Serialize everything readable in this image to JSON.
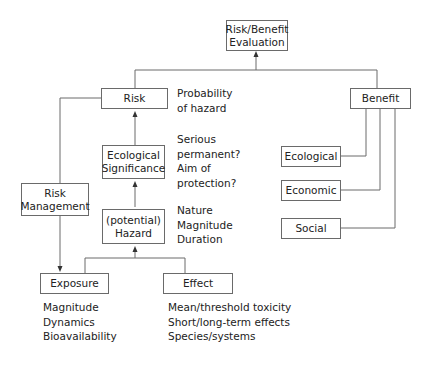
{
  "diagram": {
    "top": {
      "label_line1": "Risk/Benefit",
      "label_line2": "Evaluation"
    },
    "risk": {
      "label": "Risk",
      "note_lines": [
        "Probability",
        "of hazard"
      ]
    },
    "benefit": {
      "label": "Benefit",
      "children": [
        {
          "label": "Ecological"
        },
        {
          "label": "Economic"
        },
        {
          "label": "Social"
        }
      ]
    },
    "ecological_significance": {
      "label_line1": "Ecological",
      "label_line2": "Significance",
      "note_lines": [
        "Serious",
        "permanent?",
        "Aim of",
        "protection?"
      ]
    },
    "risk_management": {
      "label_line1": "Risk",
      "label_line2": "Management"
    },
    "hazard": {
      "label_line1": "(potential)",
      "label_line2": "Hazard",
      "note_lines": [
        "Nature",
        "Magnitude",
        "Duration"
      ]
    },
    "exposure": {
      "label": "Exposure",
      "note_lines": [
        "Magnitude",
        "Dynamics",
        "Bioavailability"
      ]
    },
    "effect": {
      "label": "Effect",
      "note_lines": [
        "Mean/threshold toxicity",
        "Short/long-term effects",
        "Species/systems"
      ]
    }
  }
}
